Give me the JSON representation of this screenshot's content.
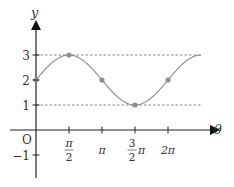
{
  "chart_data": {
    "type": "line",
    "title": "",
    "xlabel": "θ",
    "ylabel": "y",
    "function": "y = 2 + sin(θ)",
    "x_ticks": [
      {
        "value": 1.5708,
        "label_num": "π",
        "label_den": "2",
        "label": "π/2"
      },
      {
        "value": 3.1416,
        "label": "π"
      },
      {
        "value": 4.7124,
        "label_num": "3",
        "label_den": "2",
        "label_suffix": "π",
        "label": "3/2 π"
      },
      {
        "value": 6.2832,
        "label": "2π"
      }
    ],
    "y_ticks": [
      {
        "value": 3,
        "label": "3"
      },
      {
        "value": 2,
        "label": "2"
      },
      {
        "value": 1,
        "label": "1"
      },
      {
        "value": -1,
        "label": "−1"
      }
    ],
    "origin_label": "O",
    "reference_lines": [
      {
        "y": 3,
        "style": "dashed"
      },
      {
        "y": 1,
        "style": "dashed"
      }
    ],
    "marked_points": [
      {
        "x": 0,
        "y": 2
      },
      {
        "x": 1.5708,
        "y": 3
      },
      {
        "x": 3.1416,
        "y": 2
      },
      {
        "x": 4.7124,
        "y": 1
      },
      {
        "x": 6.2832,
        "y": 2
      }
    ],
    "x_range": [
      0,
      7.1
    ],
    "y_range": [
      -1.9,
      3
    ],
    "grid": false,
    "legend": null,
    "colors": {
      "curve": "#999999",
      "point": "#8f8f8f",
      "axis": "#222222",
      "dashed": "#666666"
    }
  }
}
